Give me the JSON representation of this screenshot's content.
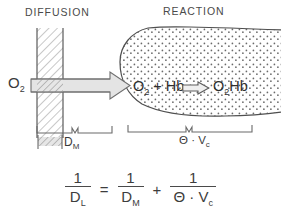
{
  "figure": {
    "headings": {
      "diffusion": "DIFFUSION",
      "reaction": "REACTION"
    },
    "left_species": "O",
    "left_species_sub": "2",
    "reaction": {
      "reactant_o2": "O",
      "reactant_o2_sub": "2",
      "plus": "+",
      "reactant_hb": "Hb",
      "arrow": "block-arrow-right",
      "product_o2": "O",
      "product_o2_sub": "2",
      "product_hb": "Hb"
    },
    "braces": {
      "membrane_label": "D",
      "membrane_label_sub": "M",
      "capillary_label": "Θ · V",
      "capillary_label_sub": "c"
    },
    "colors": {
      "ink": "#3a3a3a",
      "hatch": "#8d8d8d",
      "stipple": "#6f6f6f",
      "arrow_fill": "#e2e2e2",
      "background": "#ffffff"
    }
  },
  "equation": {
    "lhs": {
      "numerator": "1",
      "denominator": "D",
      "denominator_sub": "L"
    },
    "equals": "=",
    "term1": {
      "numerator": "1",
      "denominator": "D",
      "denominator_sub": "M"
    },
    "plus": "+",
    "term2": {
      "numerator": "1",
      "denominator": "Θ · V",
      "denominator_sub": "c"
    }
  }
}
